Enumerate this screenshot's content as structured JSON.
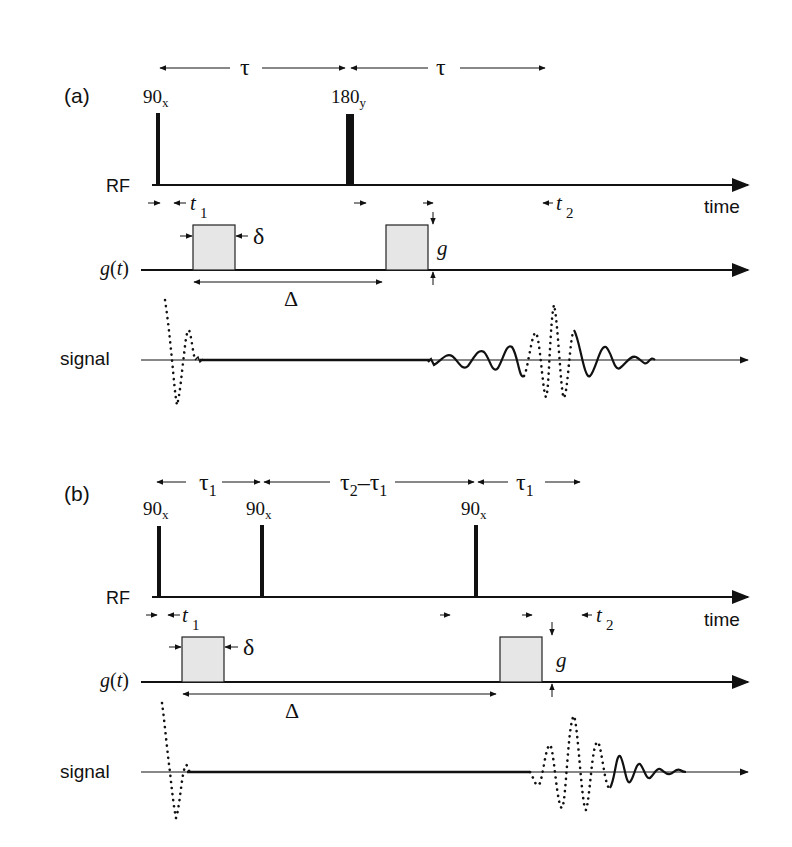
{
  "panels": [
    {
      "label": "(a)",
      "timing": [
        {
          "symbol": "τ",
          "sub": ""
        },
        {
          "symbol": "τ",
          "sub": ""
        }
      ],
      "pulses": [
        {
          "base": "90",
          "sub": "x"
        },
        {
          "base": "180",
          "sub": "y"
        }
      ],
      "rows": {
        "rf": "RF",
        "gradient": "g(t)",
        "signal": "signal",
        "time": "time"
      },
      "annotations": {
        "t1": {
          "base": "t",
          "sub": "1"
        },
        "t2": {
          "base": "t",
          "sub": "2"
        },
        "delta_small": "δ",
        "delta_big": "Δ",
        "g": "g"
      }
    },
    {
      "label": "(b)",
      "timing": [
        {
          "symbol": "τ",
          "sub": "1"
        },
        {
          "symbol": "τ₂–τ",
          "sub": "1"
        },
        {
          "symbol": "τ",
          "sub": "1"
        }
      ],
      "pulses": [
        {
          "base": "90",
          "sub": "x"
        },
        {
          "base": "90",
          "sub": "x"
        },
        {
          "base": "90",
          "sub": "x"
        }
      ],
      "rows": {
        "rf": "RF",
        "gradient": "g(t)",
        "signal": "signal",
        "time": "time"
      },
      "annotations": {
        "t1": {
          "base": "t",
          "sub": "1"
        },
        "t2": {
          "base": "t",
          "sub": "2"
        },
        "delta_small": "δ",
        "delta_big": "Δ",
        "g": "g"
      }
    }
  ],
  "tau2_label": {
    "a": "τ",
    "a_sub": "2",
    "dash": "–",
    "b": "τ",
    "b_sub": "1"
  }
}
